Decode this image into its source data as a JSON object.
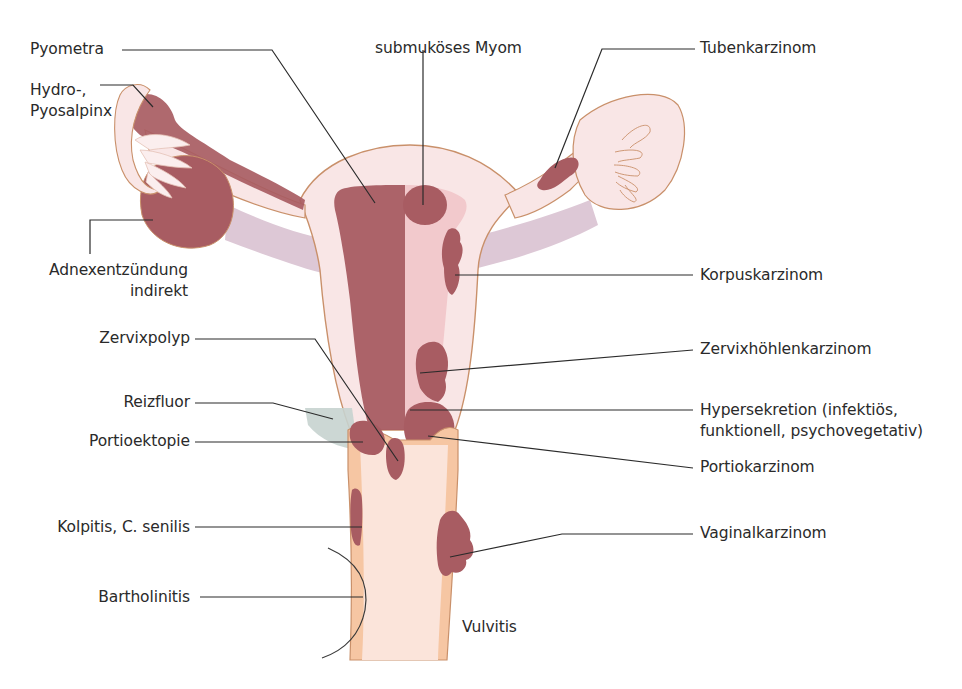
{
  "diagram": {
    "colors": {
      "background": "#ffffff",
      "tissue_light": "#f9e6e6",
      "tissue_outline": "#c9906a",
      "lesion": "#a85c62",
      "cavity": "#f2c9cc",
      "ligament": "#ddc8d6",
      "vagina": "#f6c6a3",
      "vagina_lumen": "#fbe4da",
      "discharge": "#c7d3cf",
      "leader_line": "#2b2b2b",
      "text": "#2a2a2a"
    },
    "labels_left": [
      {
        "id": "pyometra",
        "text": "Pyometra"
      },
      {
        "id": "hydro-pyosalpinx",
        "text": "Hydro-,\nPyosalpinx"
      },
      {
        "id": "adnexentzuendung",
        "text": "Adnexentzündung\nindirekt"
      },
      {
        "id": "zervixpolyp",
        "text": "Zervixpolyp"
      },
      {
        "id": "reizfluor",
        "text": "Reizfluor"
      },
      {
        "id": "portioektopie",
        "text": "Portioektopie"
      },
      {
        "id": "kolpitis",
        "text": "Kolpitis, C. senilis"
      },
      {
        "id": "bartholinitis",
        "text": "Bartholinitis"
      }
    ],
    "labels_top": [
      {
        "id": "submukoeses-myom",
        "text": "submuköses Myom"
      }
    ],
    "labels_right": [
      {
        "id": "tubenkarzinom",
        "text": "Tubenkarzinom"
      },
      {
        "id": "korpuskarzinom",
        "text": "Korpuskarzinom"
      },
      {
        "id": "zervixhoehlenkarzinom",
        "text": "Zervixhöhlenkarzinom"
      },
      {
        "id": "hypersekretion",
        "text": "Hypersekretion (infektiös,\nfunktionell, psychovegetativ)"
      },
      {
        "id": "portiokarzinom",
        "text": "Portiokarzinom"
      },
      {
        "id": "vaginalkarzinom",
        "text": "Vaginalkarzinom"
      }
    ],
    "labels_inline": [
      {
        "id": "vulvitis",
        "text": "Vulvitis"
      }
    ]
  }
}
